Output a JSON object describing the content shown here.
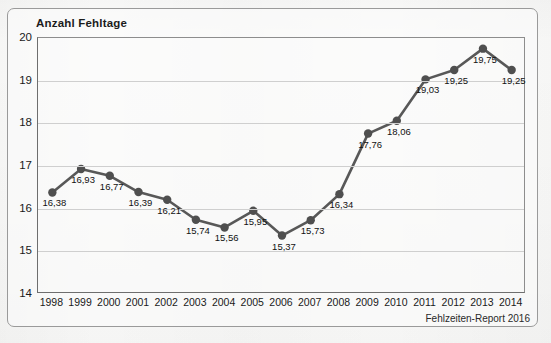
{
  "figure": {
    "title": "Anzahl Fehltage",
    "source_note": "Fehlzeiten-Report 2016"
  },
  "colors": {
    "line": "#585858",
    "marker": "#4f4f4f",
    "grid": "#cfcfcf",
    "axis": "#6e6e6e",
    "text": "#1a1a1a",
    "paper": "#fbfbfa",
    "frame": "#9a9a9a"
  },
  "chart_data": {
    "type": "line",
    "title": "Anzahl Fehltage",
    "xlabel": "",
    "ylabel": "Anzahl Fehltage",
    "ylim": [
      14,
      20
    ],
    "yticks": [
      14,
      15,
      16,
      17,
      18,
      19,
      20
    ],
    "ytick_labels": [
      "14",
      "15",
      "16",
      "17",
      "18",
      "19",
      "20"
    ],
    "grid": true,
    "legend": "none",
    "categories": [
      "1998",
      "1999",
      "2000",
      "2001",
      "2002",
      "2003",
      "2004",
      "2005",
      "2006",
      "2007",
      "2008",
      "2009",
      "2010",
      "2011",
      "2012",
      "2013",
      "2014"
    ],
    "values": [
      16.38,
      16.93,
      16.77,
      16.39,
      16.21,
      15.74,
      15.56,
      15.95,
      15.37,
      15.73,
      16.34,
      17.76,
      18.06,
      19.03,
      19.25,
      19.75,
      19.25
    ],
    "point_labels": [
      "16,38",
      "16,93",
      "16,77",
      "16,39",
      "16,21",
      "15,74",
      "15,56",
      "15,95",
      "15,37",
      "15,73",
      "16,34",
      "17,76",
      "18,06",
      "19,03",
      "19,25",
      "19,75",
      "19,25"
    ],
    "annotations": [
      "Fehlzeiten-Report 2016"
    ]
  }
}
